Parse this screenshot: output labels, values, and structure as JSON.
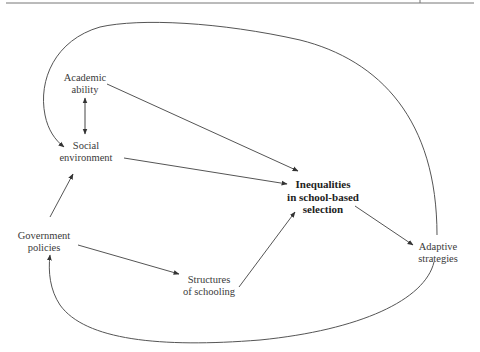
{
  "diagram": {
    "nodes": {
      "academic_ability": {
        "line1": "Academic",
        "line2": "ability"
      },
      "social_environment": {
        "line1": "Social",
        "line2": "environment"
      },
      "government_policies": {
        "line1": "Government",
        "line2": "policies"
      },
      "structures_of_schooling": {
        "line1": "Structures",
        "line2": "of schooling"
      },
      "inequalities": {
        "line1": "Inequalities",
        "line2": "in school-based",
        "line3": "selection"
      },
      "adaptive_strategies": {
        "line1": "Adaptive",
        "line2": "strategies"
      }
    },
    "edges": [
      {
        "from": "Academic ability",
        "to": "Social environment",
        "type": "bidirectional"
      },
      {
        "from": "Academic ability",
        "to": "Inequalities in school-based selection"
      },
      {
        "from": "Social environment",
        "to": "Inequalities in school-based selection"
      },
      {
        "from": "Government policies",
        "to": "Social environment"
      },
      {
        "from": "Government policies",
        "to": "Structures of schooling"
      },
      {
        "from": "Structures of schooling",
        "to": "Inequalities in school-based selection"
      },
      {
        "from": "Inequalities in school-based selection",
        "to": "Adaptive strategies"
      },
      {
        "from": "Adaptive strategies",
        "to": "Social environment",
        "type": "curved"
      },
      {
        "from": "Adaptive strategies",
        "to": "Government policies",
        "type": "curved"
      }
    ],
    "colors": {
      "line": "#555555",
      "text": "#3a3a3a"
    }
  }
}
